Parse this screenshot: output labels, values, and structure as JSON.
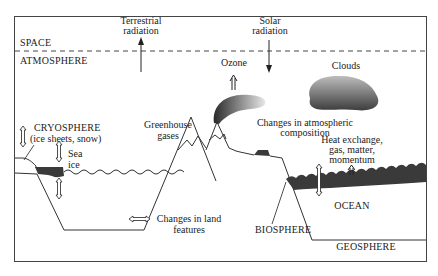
{
  "diagram": {
    "type": "climate-system-schematic",
    "zones": {
      "space": "SPACE",
      "atmosphere": "ATMOSPHERE",
      "cryosphere": "CRYOSPHERE",
      "cryosphere_sub": "(ice sheets, snow)",
      "biosphere": "BIOSPHERE",
      "ocean": "OCEAN",
      "geosphere": "GEOSPHERE"
    },
    "labels": {
      "terrestrial_1": "Terrestrial",
      "terrestrial_2": "radiation",
      "solar_1": "Solar",
      "solar_2": "radiation",
      "ozone": "Ozone",
      "clouds": "Clouds",
      "greenhouse_1": "Greenhouse",
      "greenhouse_2": "gases",
      "sea_ice_1": "Sea",
      "sea_ice_2": "ice",
      "atmos_comp_1": "Changes in atmospheric",
      "atmos_comp_2": "composition",
      "heat_1": "Heat exchange,",
      "heat_2": "gas, matter,",
      "heat_3": "momentum",
      "land_1": "Changes in land",
      "land_2": "features"
    },
    "colors": {
      "line": "#333333",
      "fill_dark": "#3a3a3a",
      "background": "#ffffff"
    }
  }
}
